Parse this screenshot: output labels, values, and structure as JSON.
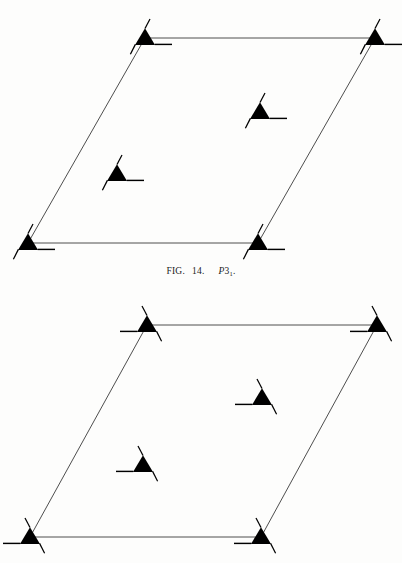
{
  "document": {
    "kind": "crystallography-space-group-plate",
    "background_color": "#fdfdfc",
    "ink_color": "#000000",
    "line_color": "#3a3a3a"
  },
  "caption": {
    "label": "FIG.",
    "number": "14.",
    "symbol_letter": "P",
    "symbol_digit": "3",
    "symbol_subscript": "1",
    "symbol_period": ".",
    "full_text": "FIG. 14.   P31."
  },
  "figures": [
    {
      "id": "fig-top",
      "name": "space-group-diagram-p31",
      "space_group": "P31",
      "symbol_handedness": "right",
      "cell": {
        "shape": "parallelogram",
        "stroke": "#3a3a3a",
        "stroke_width": 0.9,
        "corners": [
          {
            "name": "top-left",
            "x": 145,
            "y": 38
          },
          {
            "name": "top-right",
            "x": 375,
            "y": 38
          },
          {
            "name": "bottom-right",
            "x": 258,
            "y": 243
          },
          {
            "name": "bottom-left",
            "x": 28,
            "y": 243
          }
        ]
      },
      "symmetry_elements": [
        {
          "name": "screw-axis-3-1",
          "position": "corner-top-left",
          "x": 145,
          "y": 38
        },
        {
          "name": "screw-axis-3-1",
          "position": "corner-top-right",
          "x": 375,
          "y": 38
        },
        {
          "name": "screw-axis-3-1",
          "position": "corner-bottom-left",
          "x": 28,
          "y": 243
        },
        {
          "name": "screw-axis-3-1",
          "position": "corner-bottom-right",
          "x": 258,
          "y": 243
        },
        {
          "name": "screw-axis-3-1",
          "position": "interior-upper",
          "x": 260,
          "y": 112
        },
        {
          "name": "screw-axis-3-1",
          "position": "interior-lower",
          "x": 117,
          "y": 174
        }
      ]
    },
    {
      "id": "fig-bottom",
      "name": "space-group-diagram-p32",
      "space_group": "P32",
      "symbol_handedness": "left",
      "cell": {
        "shape": "parallelogram",
        "stroke": "#3a3a3a",
        "stroke_width": 0.9,
        "corners": [
          {
            "name": "top-left",
            "x": 147,
            "y": 33
          },
          {
            "name": "top-right",
            "x": 377,
            "y": 33
          },
          {
            "name": "bottom-right",
            "x": 261,
            "y": 245
          },
          {
            "name": "bottom-left",
            "x": 30,
            "y": 245
          }
        ]
      },
      "symmetry_elements": [
        {
          "name": "screw-axis-3-2",
          "position": "corner-top-left",
          "x": 147,
          "y": 33
        },
        {
          "name": "screw-axis-3-2",
          "position": "corner-top-right",
          "x": 377,
          "y": 33
        },
        {
          "name": "screw-axis-3-2",
          "position": "corner-bottom-left",
          "x": 30,
          "y": 245
        },
        {
          "name": "screw-axis-3-2",
          "position": "corner-bottom-right",
          "x": 261,
          "y": 245
        },
        {
          "name": "screw-axis-3-2",
          "position": "interior-upper",
          "x": 262,
          "y": 106
        },
        {
          "name": "screw-axis-3-2",
          "position": "interior-lower",
          "x": 143,
          "y": 173
        }
      ]
    }
  ]
}
